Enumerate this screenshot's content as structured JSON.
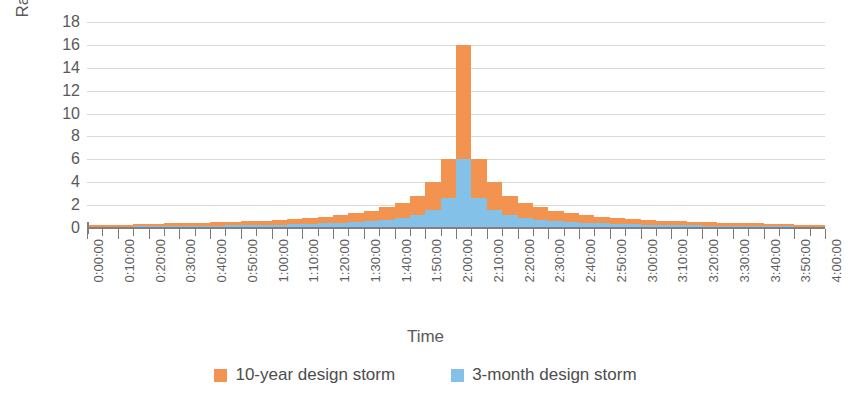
{
  "chart_data": {
    "type": "bar",
    "title": "",
    "subtitle": "",
    "xlabel": "Time",
    "ylabel": "Rainfall (mm)",
    "ylim": [
      0,
      18
    ],
    "ytick_values": [
      0,
      2,
      4,
      6,
      8,
      10,
      12,
      14,
      16,
      18
    ],
    "ytick_labels": [
      "0",
      "2",
      "4",
      "6",
      "8",
      "10",
      "12",
      "14",
      "16",
      "18"
    ],
    "grid": true,
    "grid_axis": "y",
    "legend_position": "bottom",
    "stacked": false,
    "bar_interval_minutes": 5,
    "x_tick_interval_minutes": 10,
    "x": [
      "0:00:00",
      "0:05:00",
      "0:10:00",
      "0:15:00",
      "0:20:00",
      "0:25:00",
      "0:30:00",
      "0:35:00",
      "0:40:00",
      "0:45:00",
      "0:50:00",
      "0:55:00",
      "1:00:00",
      "1:05:00",
      "1:10:00",
      "1:15:00",
      "1:20:00",
      "1:25:00",
      "1:30:00",
      "1:35:00",
      "1:40:00",
      "1:45:00",
      "1:50:00",
      "1:55:00",
      "2:00:00",
      "2:05:00",
      "2:10:00",
      "2:15:00",
      "2:20:00",
      "2:25:00",
      "2:30:00",
      "2:35:00",
      "2:40:00",
      "2:45:00",
      "2:50:00",
      "2:55:00",
      "3:00:00",
      "3:05:00",
      "3:10:00",
      "3:15:00",
      "3:20:00",
      "3:25:00",
      "3:30:00",
      "3:35:00",
      "3:40:00",
      "3:45:00",
      "3:50:00",
      "3:55:00"
    ],
    "xtick_labels": [
      "0:00:00",
      "0:10:00",
      "0:20:00",
      "0:30:00",
      "0:40:00",
      "0:50:00",
      "1:00:00",
      "1:10:00",
      "1:20:00",
      "1:30:00",
      "1:40:00",
      "1:50:00",
      "2:00:00",
      "2:10:00",
      "2:20:00",
      "2:30:00",
      "2:40:00",
      "2:50:00",
      "3:00:00",
      "3:10:00",
      "3:20:00",
      "3:30:00",
      "3:40:00",
      "3:50:00",
      "4:00:00"
    ],
    "series": [
      {
        "name": "10-year design storm",
        "color": "#F2944F",
        "values": [
          0.25,
          0.3,
          0.3,
          0.35,
          0.35,
          0.4,
          0.4,
          0.45,
          0.5,
          0.55,
          0.6,
          0.65,
          0.7,
          0.8,
          0.9,
          1.0,
          1.15,
          1.3,
          1.5,
          1.8,
          2.2,
          2.8,
          4.0,
          6.0,
          16.0,
          6.0,
          4.0,
          2.8,
          2.2,
          1.8,
          1.5,
          1.3,
          1.15,
          1.0,
          0.9,
          0.8,
          0.7,
          0.65,
          0.6,
          0.55,
          0.5,
          0.45,
          0.4,
          0.4,
          0.35,
          0.35,
          0.3,
          0.3
        ]
      },
      {
        "name": "3-month design storm",
        "color": "#83C1E8",
        "values": [
          0.1,
          0.12,
          0.12,
          0.14,
          0.14,
          0.16,
          0.16,
          0.18,
          0.2,
          0.22,
          0.24,
          0.26,
          0.3,
          0.32,
          0.36,
          0.4,
          0.45,
          0.5,
          0.6,
          0.7,
          0.85,
          1.1,
          1.6,
          2.6,
          6.0,
          2.6,
          1.6,
          1.1,
          0.85,
          0.7,
          0.6,
          0.5,
          0.45,
          0.4,
          0.36,
          0.32,
          0.3,
          0.26,
          0.24,
          0.22,
          0.2,
          0.18,
          0.16,
          0.16,
          0.14,
          0.14,
          0.12,
          0.12
        ]
      }
    ]
  },
  "axes": {
    "y_title": "Rainfall (mm)",
    "x_title": "Time"
  },
  "legend": {
    "items": [
      {
        "label": "10-year design storm",
        "color": "#F2944F"
      },
      {
        "label": "3-month design storm",
        "color": "#83C1E8"
      }
    ]
  },
  "colors": {
    "orange": "#F2944F",
    "blue": "#83C1E8",
    "gridline": "#d9d9d9",
    "axis": "#808080",
    "text": "#595959"
  }
}
